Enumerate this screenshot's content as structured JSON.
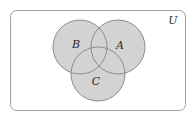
{
  "diagram": {
    "type": "venn",
    "universe": {
      "label": "U",
      "x": 10,
      "y": 10,
      "width": 175,
      "height": 100,
      "rx": 6,
      "stroke": "#a0a0a0",
      "fill": "#ffffff"
    },
    "sets": [
      {
        "id": "B",
        "label": "B",
        "cx": 80,
        "cy": 47,
        "r": 27,
        "label_x": 76,
        "label_y": 48
      },
      {
        "id": "A",
        "label": "A",
        "cx": 118,
        "cy": 47,
        "r": 27,
        "label_x": 120,
        "label_y": 49
      },
      {
        "id": "C",
        "label": "C",
        "cx": 98,
        "cy": 74,
        "r": 27,
        "label_x": 96,
        "label_y": 85
      }
    ],
    "colors": {
      "fill": "#d3d3d3",
      "stroke": "#8c8c8c"
    },
    "universe_label_pos": {
      "x": 173,
      "y": 24
    }
  }
}
